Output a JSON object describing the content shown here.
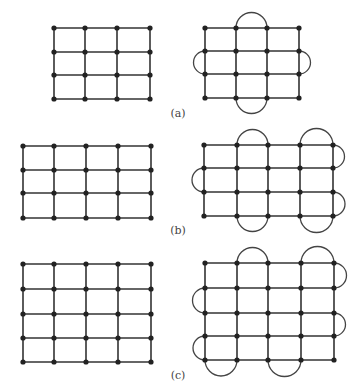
{
  "colors": {
    "line": "#333333",
    "node": "#222222",
    "arc": "#444444"
  },
  "figures": [
    {
      "label": "(a)",
      "label_pos": [
        178,
        113
      ],
      "left": {
        "xs": [
          54,
          85,
          117,
          150
        ],
        "ys": [
          28,
          52,
          75,
          99
        ]
      },
      "right": {
        "xs": [
          205,
          236,
          267,
          299
        ],
        "ys": [
          28,
          51,
          74,
          98
        ],
        "arcs": [
          {
            "side": "top",
            "from": 1,
            "to": 2
          },
          {
            "side": "left",
            "from": 1,
            "to": 2
          },
          {
            "side": "right",
            "from": 1,
            "to": 2
          },
          {
            "side": "bottom",
            "from": 1,
            "to": 2
          }
        ]
      }
    },
    {
      "label": "(b)",
      "label_pos": [
        178,
        230
      ],
      "left": {
        "xs": [
          23,
          54,
          86,
          118,
          151
        ],
        "ys": [
          146,
          170,
          193,
          218
        ]
      },
      "right": {
        "xs": [
          204,
          237,
          268,
          300,
          333
        ],
        "ys": [
          145,
          168,
          192,
          216
        ],
        "arcs": [
          {
            "side": "top",
            "from": 1,
            "to": 2
          },
          {
            "side": "top",
            "from": 3,
            "to": 4
          },
          {
            "side": "left",
            "from": 1,
            "to": 2
          },
          {
            "side": "right",
            "from": 0,
            "to": 1
          },
          {
            "side": "right",
            "from": 2,
            "to": 3
          },
          {
            "side": "bottom",
            "from": 1,
            "to": 2
          },
          {
            "side": "bottom",
            "from": 3,
            "to": 4
          }
        ]
      }
    },
    {
      "label": "(c)",
      "label_pos": [
        178,
        375
      ],
      "left": {
        "xs": [
          23,
          54,
          86,
          118,
          151
        ],
        "ys": [
          264,
          289,
          314,
          338,
          362
        ]
      },
      "right": {
        "xs": [
          205,
          237,
          268,
          301,
          334
        ],
        "ys": [
          263,
          288,
          313,
          336,
          360
        ],
        "arcs": [
          {
            "side": "top",
            "from": 1,
            "to": 2
          },
          {
            "side": "top",
            "from": 3,
            "to": 4
          },
          {
            "side": "left",
            "from": 1,
            "to": 2
          },
          {
            "side": "left",
            "from": 3,
            "to": 4
          },
          {
            "side": "right",
            "from": 0,
            "to": 1
          },
          {
            "side": "right",
            "from": 2,
            "to": 3
          },
          {
            "side": "bottom",
            "from": 0,
            "to": 1
          },
          {
            "side": "bottom",
            "from": 2,
            "to": 3
          }
        ]
      }
    }
  ]
}
